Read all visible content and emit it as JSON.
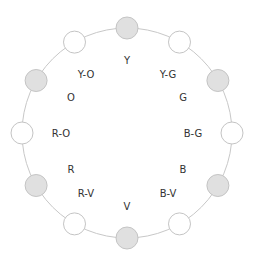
{
  "diagram": {
    "type": "color-wheel",
    "center": [
      127,
      133
    ],
    "radius": 105,
    "ring_color": "#c8c8c8",
    "node_radius": 11,
    "node_fill_gray": "#e0e0e0",
    "node_fill_white": "#ffffff",
    "node_stroke": "#c4c4c4",
    "nodes": [
      {
        "angle": 0,
        "fill": "gray"
      },
      {
        "angle": 30,
        "fill": "white"
      },
      {
        "angle": 60,
        "fill": "gray"
      },
      {
        "angle": 90,
        "fill": "white"
      },
      {
        "angle": 120,
        "fill": "gray"
      },
      {
        "angle": 150,
        "fill": "white"
      },
      {
        "angle": 180,
        "fill": "gray"
      },
      {
        "angle": 210,
        "fill": "white"
      },
      {
        "angle": 240,
        "fill": "gray"
      },
      {
        "angle": 270,
        "fill": "white"
      },
      {
        "angle": 300,
        "fill": "gray"
      },
      {
        "angle": 330,
        "fill": "white"
      }
    ],
    "labels": [
      {
        "text": "Y",
        "x": 127,
        "y": 64
      },
      {
        "text": "Y-G",
        "x": 168,
        "y": 78
      },
      {
        "text": "G",
        "x": 183,
        "y": 101
      },
      {
        "text": "B-G",
        "x": 193,
        "y": 137
      },
      {
        "text": "B",
        "x": 183,
        "y": 173
      },
      {
        "text": "B-V",
        "x": 168,
        "y": 197
      },
      {
        "text": "V",
        "x": 127,
        "y": 210
      },
      {
        "text": "R-V",
        "x": 86,
        "y": 197
      },
      {
        "text": "R",
        "x": 71,
        "y": 173
      },
      {
        "text": "R-O",
        "x": 61,
        "y": 137
      },
      {
        "text": "O",
        "x": 71,
        "y": 101
      },
      {
        "text": "Y-O",
        "x": 86,
        "y": 78
      }
    ]
  }
}
